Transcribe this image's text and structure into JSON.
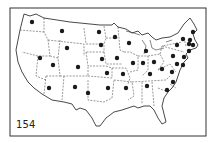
{
  "figure": {
    "number_label": "154",
    "colors": {
      "ink": "#1a1a1a",
      "paper": "#ffffff",
      "frame": "#333333"
    }
  },
  "map": {
    "frame": {
      "x": 10,
      "y": 8,
      "width": 196,
      "height": 128
    },
    "dots": [
      {
        "state": "WA",
        "x": 32,
        "y": 22
      },
      {
        "state": "MT",
        "x": 62,
        "y": 31
      },
      {
        "state": "ND",
        "x": 99,
        "y": 32
      },
      {
        "state": "MN",
        "x": 115,
        "y": 37
      },
      {
        "state": "WI",
        "x": 129,
        "y": 43
      },
      {
        "state": "MI",
        "x": 146,
        "y": 51
      },
      {
        "state": "SD",
        "x": 101,
        "y": 45
      },
      {
        "state": "WY",
        "x": 67,
        "y": 48
      },
      {
        "state": "NV",
        "x": 40,
        "y": 58
      },
      {
        "state": "UT",
        "x": 53,
        "y": 65
      },
      {
        "state": "CO",
        "x": 78,
        "y": 67
      },
      {
        "state": "NE",
        "x": 102,
        "y": 59
      },
      {
        "state": "IA",
        "x": 117,
        "y": 58
      },
      {
        "state": "IL",
        "x": 133,
        "y": 63
      },
      {
        "state": "IN",
        "x": 143,
        "y": 63
      },
      {
        "state": "OH",
        "x": 154,
        "y": 62
      },
      {
        "state": "KS",
        "x": 107,
        "y": 73
      },
      {
        "state": "MO",
        "x": 123,
        "y": 74
      },
      {
        "state": "KY",
        "x": 150,
        "y": 74
      },
      {
        "state": "WV",
        "x": 162,
        "y": 69
      },
      {
        "state": "AZ",
        "x": 49,
        "y": 88
      },
      {
        "state": "NM",
        "x": 75,
        "y": 87
      },
      {
        "state": "TX",
        "x": 88,
        "y": 93
      },
      {
        "state": "OK",
        "x": 108,
        "y": 88
      },
      {
        "state": "AR",
        "x": 126,
        "y": 88
      },
      {
        "state": "TN",
        "x": 147,
        "y": 86
      },
      {
        "state": "NC",
        "x": 173,
        "y": 82
      },
      {
        "state": "SC",
        "x": 167,
        "y": 90
      },
      {
        "state": "VA",
        "x": 172,
        "y": 72
      },
      {
        "state": "MD",
        "x": 177,
        "y": 64
      },
      {
        "state": "DE",
        "x": 183,
        "y": 65
      },
      {
        "state": "NJ",
        "x": 184,
        "y": 57
      },
      {
        "state": "PA",
        "x": 173,
        "y": 56
      },
      {
        "state": "NY",
        "x": 177,
        "y": 45
      },
      {
        "state": "CT",
        "x": 189,
        "y": 51
      },
      {
        "state": "RI",
        "x": 193,
        "y": 45
      },
      {
        "state": "MA",
        "x": 190,
        "y": 40
      },
      {
        "state": "VT",
        "x": 183,
        "y": 39
      },
      {
        "state": "NH",
        "x": 189,
        "y": 44
      },
      {
        "state": "ME",
        "x": 193,
        "y": 32
      }
    ]
  }
}
